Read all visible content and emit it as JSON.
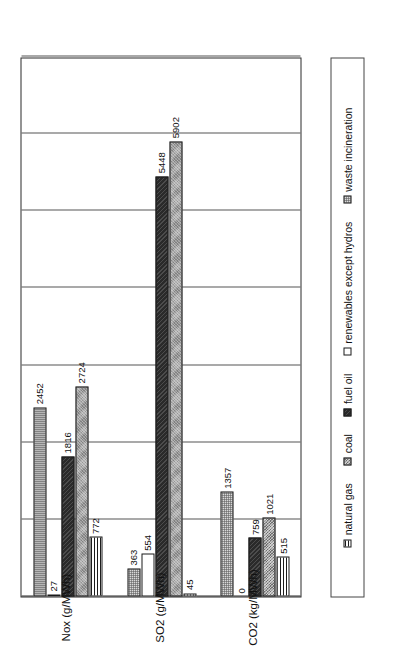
{
  "chart_data": {
    "type": "bar",
    "orientation": "horizontal-grouped",
    "title": "",
    "subtitle": "",
    "xlabel": "",
    "ylabel": "",
    "xlim": [
      0,
      7000
    ],
    "grid": true,
    "gridlines": [
      0,
      1000,
      2000,
      3000,
      4000,
      5000,
      6000,
      7000
    ],
    "legend_position": "bottom",
    "categories": [
      "CO2 (kg/MWh)",
      "SO2 (g/MWh)",
      "Nox (g/MWh)"
    ],
    "series": [
      {
        "name": "natural gas",
        "values": [
          515,
          45,
          772
        ],
        "pattern": "horizontal-lines",
        "color": "#ffffff"
      },
      {
        "name": "coal",
        "values": [
          1021,
          5902,
          2724
        ],
        "pattern": "gray-crosshatch",
        "color": "#9d9d9d"
      },
      {
        "name": "fuel oil",
        "values": [
          759,
          5448,
          1816
        ],
        "pattern": "solid-dark",
        "color": "#2a2a2a"
      },
      {
        "name": "renewables except hydros",
        "values": [
          0,
          554,
          27
        ],
        "pattern": "blank-white",
        "color": "#ffffff"
      },
      {
        "name": "waste incineration",
        "values": [
          1357,
          363,
          2452
        ],
        "pattern": "light-dotted",
        "color": "#d9d9d9"
      }
    ],
    "data_labels": {
      "CO2 (kg/MWh)": {
        "natural gas": "515",
        "coal": "1021",
        "fuel oil": "759",
        "renewables except hydros": "0",
        "waste incineration": "1357"
      },
      "SO2 (g/MWh)": {
        "natural gas": "45",
        "coal": "5902",
        "fuel oil": "5448",
        "renewables except hydros": "554",
        "waste incineration": "363"
      },
      "Nox (g/MWh)": {
        "natural gas": "772",
        "coal": "2724",
        "fuel oil": "1816",
        "renewables except hydros": "27",
        "waste incineration": "2452"
      }
    }
  },
  "legend": {
    "items": [
      {
        "label": "natural gas"
      },
      {
        "label": "coal"
      },
      {
        "label": "fuel oil"
      },
      {
        "label": "renewables except hydros"
      },
      {
        "label": "waste incineration"
      }
    ]
  },
  "axis": {
    "category_labels": [
      "CO2 (kg/MWh)",
      "SO2 (g/MWh)",
      "Nox (g/MWh)"
    ]
  }
}
